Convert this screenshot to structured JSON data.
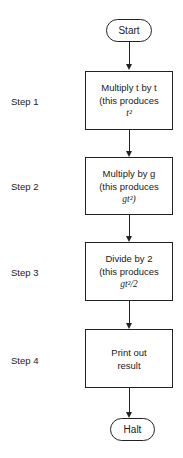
{
  "diagram": {
    "start": "Start",
    "halt": "Halt",
    "steps": [
      {
        "label": "Step 1",
        "line1": "Multiply t by t",
        "line2": "(this produces",
        "line3": "t²"
      },
      {
        "label": "Step 2",
        "line1": "Multiply by g",
        "line2": "(this produces",
        "line3": "gt²)"
      },
      {
        "label": "Step 3",
        "line1": "Divide by 2",
        "line2": "(this produces",
        "line3": "gt²/2"
      },
      {
        "label": "Step 4",
        "line1": "Print out",
        "line2": "result",
        "line3": ""
      }
    ],
    "line_color": "#222222"
  }
}
